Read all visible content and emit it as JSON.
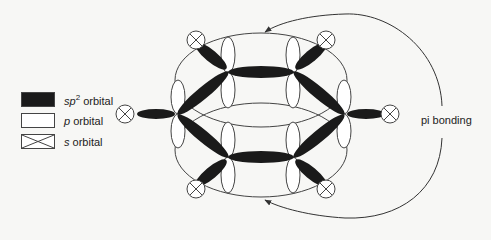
{
  "legend": {
    "items": [
      {
        "symbol": "black-filled-box",
        "prefix": "sp",
        "sup": "2",
        "text": " orbital"
      },
      {
        "symbol": "white-box",
        "prefix": "p",
        "sup": "",
        "text": " orbital"
      },
      {
        "symbol": "crossed-box",
        "prefix": "s",
        "sup": "",
        "text": " orbital"
      }
    ]
  },
  "annotation": {
    "pi_bonding": "pi bonding"
  }
}
